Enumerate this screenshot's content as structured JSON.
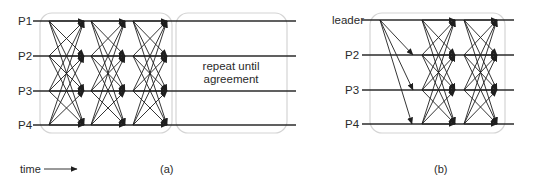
{
  "diagram_a": {
    "caption": "(a)",
    "process_labels": [
      "P1",
      "P2",
      "P3",
      "P4"
    ],
    "round_box_note": [
      "repeat until",
      "agreement"
    ],
    "time_label": "time",
    "rounds": 3,
    "pattern": "all-to-all"
  },
  "diagram_b": {
    "caption": "(b)",
    "process_labels": [
      "leader",
      "P2",
      "P3",
      "P4"
    ],
    "leader_broadcast_targets": [
      "P2",
      "P3",
      "P4"
    ],
    "all_to_all_rounds": 2
  },
  "colors": {
    "line": "#2b2b2b",
    "arrow": "#1e1e1e",
    "box": "#d4d4d4",
    "text": "#2a2a2a"
  }
}
